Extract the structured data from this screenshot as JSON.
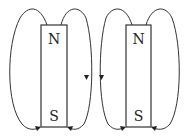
{
  "diagram": {
    "title": "",
    "colors": {
      "line": "#333333",
      "text": "#222222",
      "background": "#ffffff"
    },
    "magnets": [
      {
        "id": "magnet-left",
        "top_label": "N",
        "bottom_label": "S"
      },
      {
        "id": "magnet-right",
        "top_label": "N",
        "bottom_label": "S"
      }
    ],
    "field_lines": [
      {
        "magnet": "left",
        "side": "left",
        "direction": "N-to-S",
        "arrow": "at south end"
      },
      {
        "magnet": "left",
        "side": "right",
        "direction": "N-to-S",
        "arrow": "mid-line pointing down and at south end"
      },
      {
        "magnet": "right",
        "side": "left",
        "direction": "N-to-S",
        "arrow": "mid-line pointing down and at south end"
      },
      {
        "magnet": "right",
        "side": "right",
        "direction": "N-to-S",
        "arrow": "at south end"
      }
    ]
  }
}
